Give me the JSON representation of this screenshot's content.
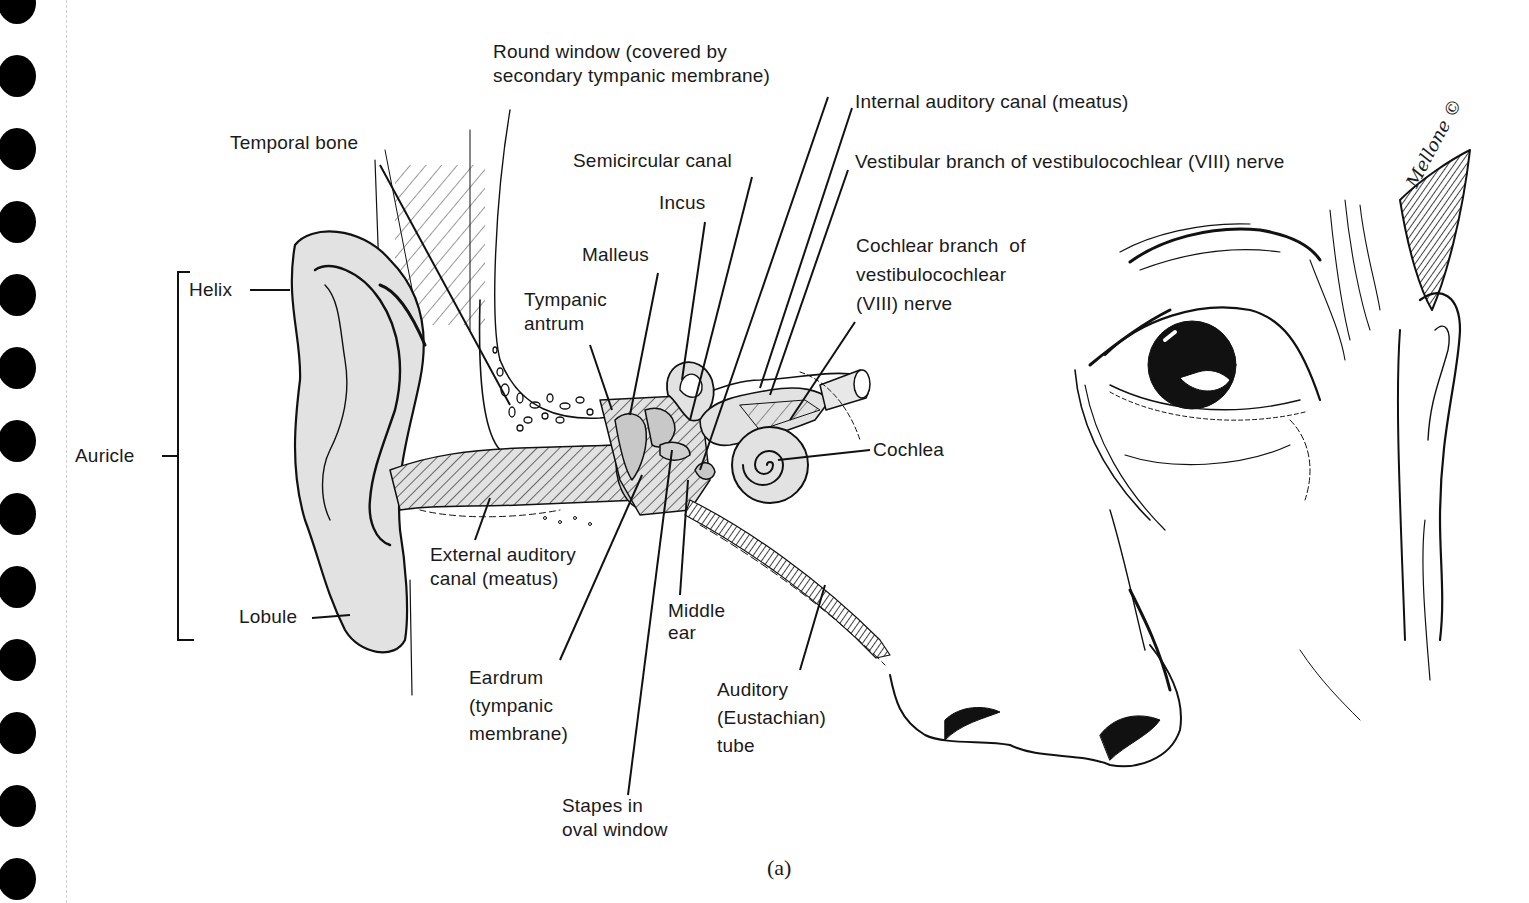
{
  "figure": {
    "caption": "(a)",
    "signature": "Mellone ©",
    "colors": {
      "ink": "#111111",
      "ear_fill": "#e2e2e2",
      "binding_hole": "#000000",
      "background": "#ffffff"
    }
  },
  "binding": {
    "hole_count": 13
  },
  "labels": {
    "round_window": [
      "Round window (covered by",
      "secondary tympanic membrane)"
    ],
    "internal_auditory_canal": "Internal auditory canal (meatus)",
    "vestibular_branch": "Vestibular branch of vestibulocochlear (VIII) nerve",
    "temporal_bone": "Temporal bone",
    "semicircular_canal": "Semicircular canal",
    "incus": "Incus",
    "malleus": "Malleus",
    "tympanic_antrum": [
      "Tympanic",
      "antrum"
    ],
    "cochlear_branch": [
      "Cochlear branch  of",
      "vestibulocochlear",
      "(VIII) nerve"
    ],
    "helix": "Helix",
    "auricle": "Auricle",
    "cochlea": "Cochlea",
    "external_auditory_canal": [
      "External auditory",
      "canal (meatus)"
    ],
    "lobule": "Lobule",
    "middle_ear": [
      "Middle",
      "ear"
    ],
    "eardrum": [
      "Eardrum",
      "(tympanic",
      "membrane)"
    ],
    "auditory_tube": [
      "Auditory",
      "(Eustachian)",
      "tube"
    ],
    "stapes": [
      "Stapes in",
      "oval window"
    ]
  }
}
